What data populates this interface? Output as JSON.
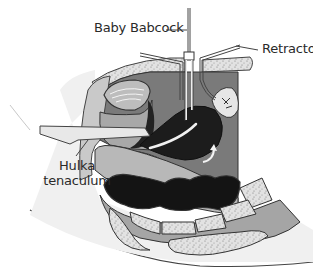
{
  "figure": {
    "type": "sagittal-section-illustration",
    "style": "grayscale-medical-drawing",
    "colors": {
      "background": "#ffffff",
      "light_tissue": "#e4e4e4",
      "mid_tissue": "#b4b4b4",
      "cavity_gray": "#7a7a7a",
      "dark_organ": "#1c1c1c",
      "bone_stipple": "#dcdcdc",
      "outline": "#333333"
    }
  },
  "labels": {
    "baby_babcock": "Baby Babcock",
    "retractor": "Retractor",
    "hulka_line1": "Hulka",
    "hulka_line2": "tenaculum"
  },
  "icons": {
    "arrow": "curved-arrow-up-right"
  }
}
